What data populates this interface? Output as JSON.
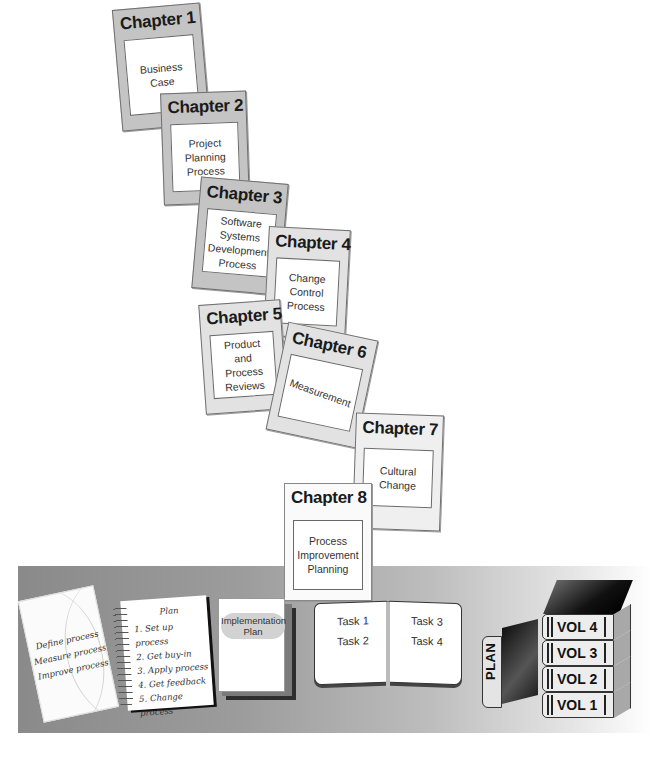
{
  "chapters": [
    {
      "title": "Chapter 1",
      "body": "Business\nCase"
    },
    {
      "title": "Chapter 2",
      "body": "Project\nPlanning\nProcess"
    },
    {
      "title": "Chapter 3",
      "body": "Software\nSystems\nDevelopment\nProcess"
    },
    {
      "title": "Chapter 4",
      "body": "Change\nControl\nProcess"
    },
    {
      "title": "Chapter 5",
      "body": "Product\nand\nProcess\nReviews"
    },
    {
      "title": "Chapter 6",
      "body": "Measurement"
    },
    {
      "title": "Chapter 7",
      "body": "Cultural\nChange"
    },
    {
      "title": "Chapter 8",
      "body": "Process\nImprovement\nPlanning"
    }
  ],
  "process_card": {
    "lines": [
      "Define process",
      "Measure process",
      "Improve process"
    ]
  },
  "notebook": {
    "title": "Plan",
    "items": [
      "1. Set up process",
      "2. Get buy-in",
      "3. Apply process",
      "4. Get feedback",
      "5. Change process"
    ]
  },
  "implementation_plan": {
    "label": "Implementation\nPlan"
  },
  "task_book": {
    "left": [
      "Task 1",
      "Task 2"
    ],
    "right": [
      "Task 3",
      "Task 4"
    ]
  },
  "plan_book": {
    "label": "PLAN"
  },
  "volumes": [
    "VOL 4",
    "VOL 3",
    "VOL 2",
    "VOL 1"
  ],
  "colors": {
    "band_dark": "#8a8a8a",
    "card_gray": "#c4c4c4",
    "book_black": "#111111"
  }
}
